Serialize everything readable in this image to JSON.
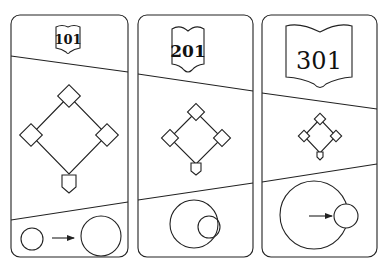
{
  "panels": [
    {
      "label": "101",
      "font_size": 13
    },
    {
      "label": "201",
      "font_size": 17
    },
    {
      "label": "301",
      "font_size": 22
    }
  ],
  "colors": {
    "stroke": "#222222",
    "background": "#ffffff"
  }
}
